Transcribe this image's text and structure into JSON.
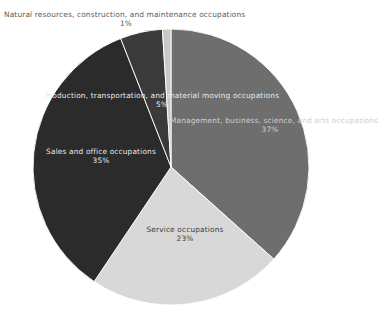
{
  "chart_data": {
    "type": "pie",
    "title": "",
    "subtitle": "",
    "xlabel": "",
    "ylabel": "",
    "legend_position": "none",
    "grid": false,
    "labels_on_slices": true,
    "value_unit": "percent",
    "total": 101,
    "start_angle_deg": 0,
    "direction": "clockwise",
    "categories": [
      "Management, business, science, and arts occupations",
      "Service occupations",
      "Sales and office occupations",
      "Production, transportation, and material moving occupations",
      "Natural resources, construction, and maintenance occupations"
    ],
    "values": [
      37,
      23,
      35,
      5,
      1
    ],
    "value_labels": [
      "37%",
      "23%",
      "35%",
      "5%",
      "1%"
    ],
    "colors": [
      "#6e6e6e",
      "#d8d8d8",
      "#2b2b2b",
      "#3a3a3a",
      "#c8c8c8"
    ],
    "slices": [
      {
        "name": "Management, business, science, and arts occupations",
        "value": 37,
        "value_label": "37%",
        "color": "#6e6e6e"
      },
      {
        "name": "Service occupations",
        "value": 23,
        "value_label": "23%",
        "color": "#d8d8d8"
      },
      {
        "name": "Sales and office occupations",
        "value": 35,
        "value_label": "35%",
        "color": "#2b2b2b"
      },
      {
        "name": "Production, transportation, and material moving occupations",
        "value": 5,
        "value_label": "5%",
        "color": "#3a3a3a"
      },
      {
        "name": "Natural resources, construction, and maintenance occupations",
        "value": 1,
        "value_label": "1%",
        "color": "#c8c8c8"
      }
    ],
    "geometry": {
      "center_x": 171,
      "center_y": 167,
      "radius": 138
    },
    "background_color": "#ffffff"
  }
}
